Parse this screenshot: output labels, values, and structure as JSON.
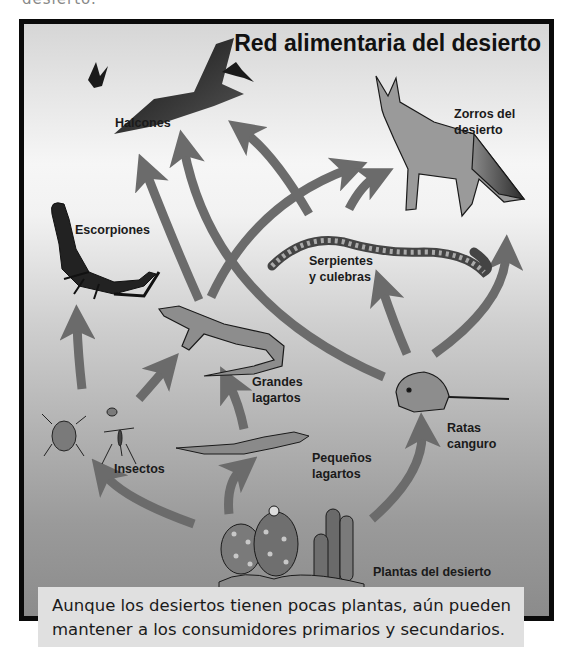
{
  "header": {
    "cut_text": "desierto."
  },
  "diagram": {
    "title": "Red alimentaria del desierto",
    "organisms": [
      {
        "id": "halcones",
        "label": "Halcones"
      },
      {
        "id": "zorros",
        "label_line1": "Zorros del",
        "label_line2": "desierto"
      },
      {
        "id": "escorpiones",
        "label": "Escorpiones"
      },
      {
        "id": "serpientes",
        "label_line1": "Serpientes",
        "label_line2": "y culebras"
      },
      {
        "id": "grandes_lagartos",
        "label_line1": "Grandes",
        "label_line2": "lagartos"
      },
      {
        "id": "ratas",
        "label_line1": "Ratas",
        "label_line2": "canguro"
      },
      {
        "id": "insectos",
        "label": "Insectos"
      },
      {
        "id": "pequenos_lagartos",
        "label_line1": "Pequeños",
        "label_line2": "lagartos"
      },
      {
        "id": "plantas",
        "label": "Plantas del desierto"
      }
    ],
    "arrows": [
      {
        "from": "plantas",
        "to": "insectos"
      },
      {
        "from": "plantas",
        "to": "pequenos_lagartos"
      },
      {
        "from": "plantas",
        "to": "ratas"
      },
      {
        "from": "insectos",
        "to": "escorpiones"
      },
      {
        "from": "insectos",
        "to": "grandes_lagartos"
      },
      {
        "from": "pequenos_lagartos",
        "to": "grandes_lagartos"
      },
      {
        "from": "grandes_lagartos",
        "to": "halcones"
      },
      {
        "from": "grandes_lagartos",
        "to": "zorros"
      },
      {
        "from": "ratas",
        "to": "halcones"
      },
      {
        "from": "ratas",
        "to": "serpientes"
      },
      {
        "from": "ratas",
        "to": "zorros"
      },
      {
        "from": "serpientes",
        "to": "halcones"
      },
      {
        "from": "serpientes",
        "to": "zorros"
      },
      {
        "from": "escorpiones",
        "to": "halcones"
      }
    ],
    "colors": {
      "frame": "#0a0a0a",
      "arrow": "#6b6b6b",
      "caption_bg": "#e0e0e0"
    }
  },
  "caption": {
    "line1": "Aunque los desiertos tienen pocas plantas, aún pueden",
    "line2": "mantener a los consumidores primarios y secundarios."
  }
}
